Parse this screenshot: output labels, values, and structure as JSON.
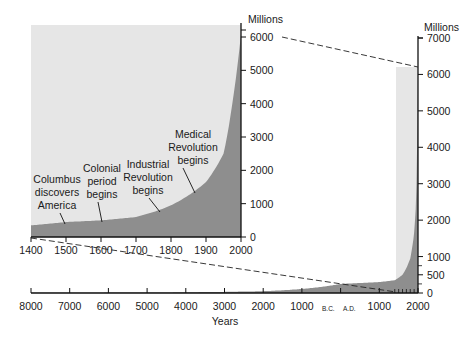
{
  "chart_data": [
    {
      "id": "inset",
      "type": "area",
      "title": "",
      "xlabel": "",
      "ylabel": "Millions",
      "x_ticks": [
        "1400",
        "1500",
        "1600",
        "1700",
        "1800",
        "1900",
        "2000"
      ],
      "y_ticks": [
        "0",
        "1000",
        "2000",
        "3000",
        "4000",
        "5000",
        "6000"
      ],
      "xlim": [
        1400,
        2000
      ],
      "ylim": [
        0,
        6000
      ],
      "grid": false,
      "series": [
        {
          "name": "World population",
          "x": [
            1400,
            1500,
            1600,
            1700,
            1750,
            1800,
            1850,
            1900,
            1950,
            1975,
            2000
          ],
          "values": [
            350,
            450,
            500,
            600,
            750,
            950,
            1250,
            1650,
            2500,
            4000,
            6100
          ]
        }
      ],
      "annotations": [
        {
          "text": [
            "Columbus",
            "discovers",
            "America"
          ],
          "year": 1492
        },
        {
          "text": [
            "Colonial",
            "period",
            "begins"
          ],
          "year": 1600
        },
        {
          "text": [
            "Industrial",
            "Revolution",
            "begins"
          ],
          "year": 1750
        },
        {
          "text": [
            "Medical",
            "Revolution",
            "begins"
          ],
          "year": 1850
        }
      ]
    },
    {
      "id": "main",
      "type": "area",
      "title": "",
      "xlabel": "Years",
      "ylabel": "Millions",
      "x_ticks": [
        "8000",
        "7000",
        "6000",
        "5000",
        "4000",
        "3000",
        "2000",
        "1000",
        "B.C.  A.D.",
        "1000",
        "2000"
      ],
      "y_ticks": [
        "0",
        "500",
        "1000",
        "2000",
        "3000",
        "4000",
        "5000",
        "6000",
        "7000"
      ],
      "xlim": [
        -8000,
        2000
      ],
      "ylim": [
        0,
        7000
      ],
      "grid": false,
      "series": [
        {
          "name": "World population",
          "x": [
            -8000,
            -6000,
            -4000,
            -2000,
            0,
            1000,
            1400,
            1600,
            1800,
            1900,
            1950,
            2000
          ],
          "values": [
            5,
            10,
            20,
            50,
            250,
            300,
            350,
            500,
            950,
            1650,
            2500,
            6100
          ]
        }
      ]
    }
  ],
  "labels": {
    "inset_unit": "Millions",
    "main_unit": "Millions",
    "x_axis_title": "Years",
    "bc": "B.C.",
    "ad": "A.D."
  },
  "colors": {
    "background_light": "#e6e6e6",
    "area_fill": "#8e8e8e",
    "axis": "#111111"
  }
}
